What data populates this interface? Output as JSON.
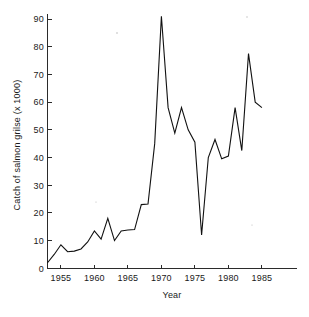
{
  "chart_data": {
    "type": "line",
    "title": "",
    "xlabel": "Year",
    "ylabel": "Catch of salmon grilse (x 1000)",
    "xlim": [
      1953,
      1986
    ],
    "ylim": [
      0,
      93
    ],
    "grid": false,
    "legend": "none",
    "line_color": "#111111",
    "xticks": [
      1955,
      1960,
      1965,
      1970,
      1975,
      1980,
      1985
    ],
    "xtick_labels": [
      "1955",
      "1960",
      "1965",
      "1970",
      "1975",
      "1980",
      "1985"
    ],
    "yticks": [
      0,
      10,
      20,
      30,
      40,
      50,
      60,
      70,
      80,
      90
    ],
    "ytick_labels": [
      "0",
      "10",
      "20",
      "30",
      "40",
      "50",
      "60",
      "70",
      "80",
      "90"
    ],
    "x": [
      1953,
      1954,
      1955,
      1956,
      1957,
      1958,
      1959,
      1960,
      1961,
      1962,
      1963,
      1964,
      1965,
      1966,
      1967,
      1968,
      1969,
      1970,
      1971,
      1972,
      1973,
      1974,
      1975,
      1976,
      1977,
      1978,
      1979,
      1980,
      1981,
      1982,
      1983,
      1984,
      1985
    ],
    "values": [
      2,
      5,
      8.5,
      6,
      6.2,
      7,
      9.5,
      13.5,
      10.5,
      18,
      10,
      13.5,
      13.8,
      14,
      23,
      23.2,
      45,
      91,
      58,
      48.8,
      58,
      50,
      45.5,
      12,
      40,
      46.5,
      39.5,
      40.5,
      58,
      42.5,
      77.5,
      60,
      58
    ],
    "series": [
      {
        "name": "Catch of salmon grilse",
        "values": [
          2,
          5,
          8.5,
          6,
          6.2,
          7,
          9.5,
          13.5,
          10.5,
          18,
          10,
          13.5,
          13.8,
          14,
          23,
          23.2,
          45,
          91,
          58,
          48.8,
          58,
          50,
          45.5,
          12,
          40,
          46.5,
          39.5,
          40.5,
          58,
          42.5,
          77.5,
          60,
          58
        ]
      }
    ]
  }
}
